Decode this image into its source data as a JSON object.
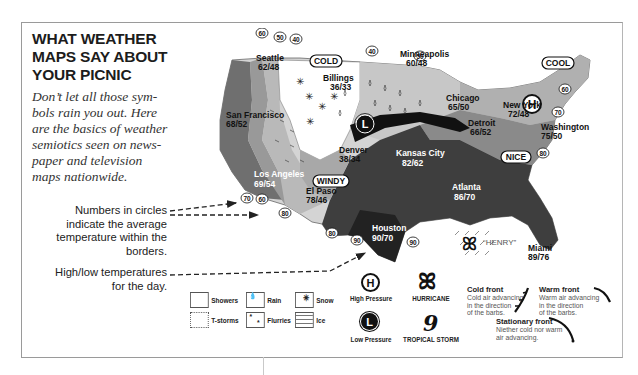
{
  "header": {
    "title_lines": [
      "WHAT WEATHER",
      "MAPS SAY ABOUT",
      "YOUR PICNIC"
    ],
    "intro_lines": [
      "Don’t let all those sym-",
      "bols rain you out. Here",
      "are the basics of weather",
      "semiotics seen on news-",
      "paper and television",
      "maps nationwide."
    ]
  },
  "callouts": {
    "circles_lines": [
      "Numbers in circles",
      "indicate the average",
      "temperature within the",
      "borders."
    ],
    "highlow_lines": [
      "High/low temperatures",
      "for the day."
    ]
  },
  "map": {
    "cities": [
      {
        "name": "Seattle",
        "temps": "62/48"
      },
      {
        "name": "Billings",
        "temps": "36/33"
      },
      {
        "name": "Minneapolis",
        "temps": "60/48"
      },
      {
        "name": "Chicago",
        "temps": "65/50"
      },
      {
        "name": "Detroit",
        "temps": "66/52"
      },
      {
        "name": "New York",
        "temps": "72/48"
      },
      {
        "name": "Washington",
        "temps": "75/50"
      },
      {
        "name": "San Francisco",
        "temps": "68/52"
      },
      {
        "name": "Denver",
        "temps": "38/34"
      },
      {
        "name": "Kansas City",
        "temps": "82/62"
      },
      {
        "name": "Los Angeles",
        "temps": "69/54"
      },
      {
        "name": "El Paso",
        "temps": "78/46"
      },
      {
        "name": "Atlanta",
        "temps": "86/70"
      },
      {
        "name": "Houston",
        "temps": "90/70"
      },
      {
        "name": "Miami",
        "temps": "89/76"
      }
    ],
    "condition_labels": [
      "COLD",
      "COOL",
      "WINDY",
      "NICE"
    ],
    "storm_name": "“HENRY”",
    "isotherms": [
      "60",
      "50",
      "40",
      "40",
      "50",
      "60",
      "70",
      "80",
      "70",
      "60",
      "80",
      "80",
      "90",
      "90"
    ],
    "high_letter": "H",
    "low_letter": "L"
  },
  "legend": {
    "precip": [
      {
        "label": "Showers"
      },
      {
        "label": "Rain"
      },
      {
        "label": "Snow"
      },
      {
        "label": "T-storms"
      },
      {
        "label": "Flurries"
      },
      {
        "label": "Ice"
      }
    ],
    "high_pressure": {
      "letter": "H",
      "label": "High Pressure"
    },
    "low_pressure": {
      "letter": "L",
      "label": "Low Pressure"
    },
    "hurricane": {
      "label": "HURRICANE"
    },
    "tropical_storm": {
      "label": "TROPICAL STORM"
    },
    "fronts": [
      {
        "title": "Cold front",
        "desc_lines": [
          "Cold air advancing",
          "in the direction",
          "of the barbs."
        ]
      },
      {
        "title": "Warm front",
        "desc_lines": [
          "Warm air advancing",
          "in the direction",
          "of the barbs."
        ]
      },
      {
        "title": "Stationary front",
        "desc_lines": [
          "Niether cold nor warm",
          "air advancing."
        ]
      }
    ]
  },
  "colors": {
    "border": "#9a9a9a",
    "text": "#1c1c1c",
    "region_dark": "#3a3a3a",
    "region_mid": "#7a7a7a",
    "region_light": "#b8b8b8",
    "region_pale": "#d9d9d9"
  }
}
